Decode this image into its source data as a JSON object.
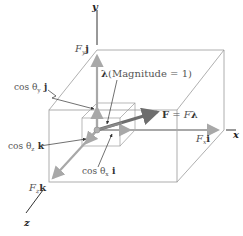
{
  "figure": {
    "axes": {
      "x": "x",
      "y": "y",
      "z": "z"
    },
    "labels": {
      "fy": {
        "coef": "F",
        "sub": "y",
        "vec": "j"
      },
      "fx": {
        "coef": "F",
        "sub": "x",
        "vec": "i"
      },
      "fz": {
        "coef": "F",
        "sub": "z",
        "vec": "k"
      },
      "lambda": {
        "symbol": "λ",
        "text": "(Magnitude = 1)"
      },
      "force": {
        "text_left": "F",
        "eq": " = ",
        "text_right": "F",
        "symbol": "λ"
      },
      "cos_y": {
        "pre": "cos θ",
        "sub": "y",
        "vec": " j"
      },
      "cos_z": {
        "pre": "cos θ",
        "sub": "z",
        "vec": " k"
      },
      "cos_x": {
        "pre": "cos θ",
        "sub": "x",
        "vec": " i"
      }
    },
    "colors": {
      "box_lines": "#9a9a9a",
      "axis_lines": "#333333",
      "component_arrows": "#a8a8a8",
      "force_arrow": "#6e6e6e",
      "leader_lines": "#333333"
    }
  }
}
